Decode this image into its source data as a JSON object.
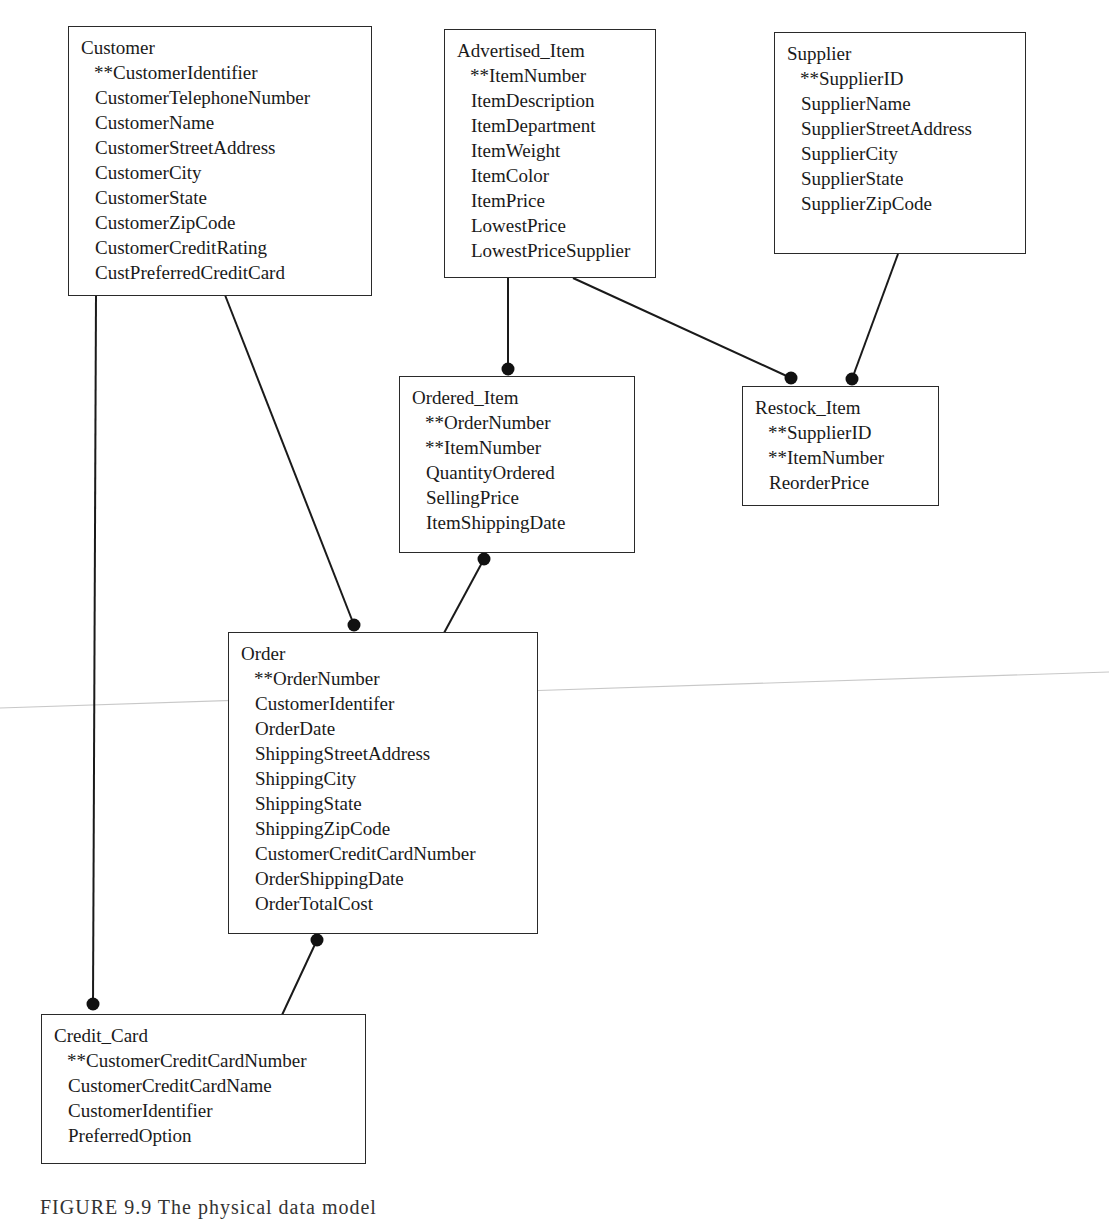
{
  "diagram": {
    "type": "physical data model (entity relationship diagram)",
    "caption": "FIGURE 9.9   The physical data model",
    "entities": {
      "customer": {
        "name": "Customer",
        "attributes": [
          "**CustomerIdentifier",
          "CustomerTelephoneNumber",
          "CustomerName",
          "CustomerStreetAddress",
          "CustomerCity",
          "CustomerState",
          "CustomerZipCode",
          "CustomerCreditRating",
          "CustPreferredCreditCard"
        ]
      },
      "advertised_item": {
        "name": "Advertised_Item",
        "attributes": [
          "**ItemNumber",
          "ItemDescription",
          "ItemDepartment",
          "ItemWeight",
          "ItemColor",
          "ItemPrice",
          "LowestPrice",
          "LowestPriceSupplier"
        ]
      },
      "supplier": {
        "name": "Supplier",
        "attributes": [
          "**SupplierID",
          "SupplierName",
          "SupplierStreetAddress",
          "SupplierCity",
          "SupplierState",
          "SupplierZipCode"
        ]
      },
      "ordered_item": {
        "name": "Ordered_Item",
        "attributes": [
          "**OrderNumber",
          "**ItemNumber",
          "QuantityOrdered",
          "SellingPrice",
          "ItemShippingDate"
        ]
      },
      "restock_item": {
        "name": "Restock_Item",
        "attributes": [
          "**SupplierID",
          "**ItemNumber",
          "ReorderPrice"
        ]
      },
      "order": {
        "name": "Order",
        "attributes": [
          "**OrderNumber",
          "CustomerIdentifer",
          "OrderDate",
          "ShippingStreetAddress",
          "ShippingCity",
          "ShippingState",
          "ShippingZipCode",
          "CustomerCreditCardNumber",
          "OrderShippingDate",
          "OrderTotalCost"
        ]
      },
      "credit_card": {
        "name": "Credit_Card",
        "attributes": [
          "**CustomerCreditCardNumber",
          "CustomerCreditCardName",
          "CustomerIdentifier",
          "PreferredOption"
        ]
      }
    },
    "relationships": [
      {
        "from": "Customer",
        "to": "Order",
        "many_end": "Order"
      },
      {
        "from": "Customer",
        "to": "Credit_Card",
        "many_end": "Credit_Card"
      },
      {
        "from": "Advertised_Item",
        "to": "Ordered_Item",
        "many_end": "Ordered_Item"
      },
      {
        "from": "Advertised_Item",
        "to": "Restock_Item",
        "many_end": "Restock_Item"
      },
      {
        "from": "Supplier",
        "to": "Restock_Item",
        "many_end": "Restock_Item"
      },
      {
        "from": "Order",
        "to": "Ordered_Item",
        "many_end": "Ordered_Item"
      },
      {
        "from": "Credit_Card",
        "to": "Order",
        "many_end": "Order"
      }
    ],
    "legend": {
      "primary_key_marker": "**"
    },
    "colors": {
      "line": "#1a1a1a",
      "box_border": "#2a2a2a",
      "background": "#ffffff",
      "scan_artifact": "#c8c8c8"
    }
  }
}
